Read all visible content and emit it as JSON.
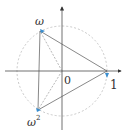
{
  "diagram": {
    "labels": {
      "origin": "0",
      "one": "1",
      "omega": "ω",
      "omega_squared_base": "ω",
      "omega_squared_exp": "2"
    },
    "points": [
      {
        "name": "1",
        "x": 107,
        "y": 71
      },
      {
        "name": "ω",
        "x": 40,
        "y": 31
      },
      {
        "name": "ω²",
        "x": 38,
        "y": 110
      }
    ],
    "center": {
      "x": 62,
      "y": 71
    },
    "radius": 45,
    "colors": {
      "axis": "#333333",
      "circle": "#bbbbbb",
      "triangle": "#555555",
      "marker": "#3b8fd0"
    }
  }
}
